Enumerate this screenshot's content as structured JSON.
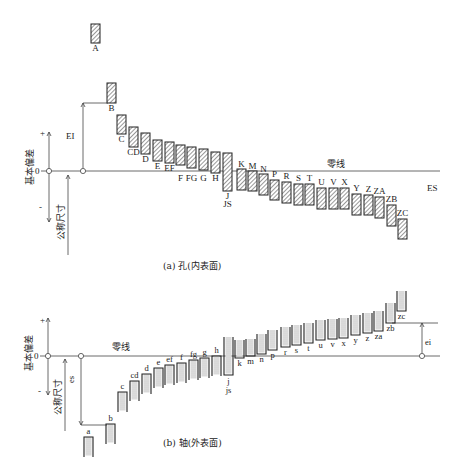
{
  "diagram": {
    "panel_a": {
      "caption": "(a) 孔(内表面)",
      "y_axis_label": "基本偏差",
      "nominal_label": "公称尺寸",
      "zero_label": "0",
      "plus_label": "+",
      "minus_label": "-",
      "zero_line_label": "零线",
      "lower_deviation_label": "EI",
      "upper_deviation_label": "ES",
      "boxes": [
        {
          "label": "A",
          "x": 91,
          "top": 24,
          "bottom": 43
        },
        {
          "label": "B",
          "x": 107,
          "top": 83,
          "bottom": 103
        },
        {
          "label": "C",
          "x": 117,
          "top": 115,
          "bottom": 134
        },
        {
          "label": "CD",
          "x": 129,
          "top": 127,
          "bottom": 147
        },
        {
          "label": "D",
          "x": 141,
          "top": 133,
          "bottom": 154
        },
        {
          "label": "E",
          "x": 153,
          "top": 140,
          "bottom": 161
        },
        {
          "label": "EF",
          "x": 165,
          "top": 142,
          "bottom": 163
        },
        {
          "label": "F",
          "x": 176,
          "top": 145,
          "bottom": 165
        },
        {
          "label": "FG",
          "x": 187,
          "top": 147,
          "bottom": 168
        },
        {
          "label": "G",
          "x": 199,
          "top": 149,
          "bottom": 170
        },
        {
          "label": "H",
          "x": 211,
          "top": 152,
          "bottom": 173
        },
        {
          "label": "J",
          "sub": "JS",
          "x": 223,
          "top": 153,
          "bottom": 191
        },
        {
          "label": "K",
          "x": 237,
          "top": 169,
          "bottom": 190
        },
        {
          "label": "M",
          "x": 248,
          "top": 171,
          "bottom": 191
        },
        {
          "label": "N",
          "x": 259,
          "top": 174,
          "bottom": 195
        },
        {
          "label": "P",
          "x": 270,
          "top": 180,
          "bottom": 200
        },
        {
          "label": "R",
          "x": 282,
          "top": 182,
          "bottom": 203
        },
        {
          "label": "S",
          "x": 294,
          "top": 184,
          "bottom": 205
        },
        {
          "label": "T",
          "x": 305,
          "top": 184,
          "bottom": 205
        },
        {
          "label": "U",
          "x": 317,
          "top": 188,
          "bottom": 209
        },
        {
          "label": "V",
          "x": 329,
          "top": 188,
          "bottom": 209
        },
        {
          "label": "X",
          "x": 340,
          "top": 188,
          "bottom": 209
        },
        {
          "label": "Y",
          "x": 352,
          "top": 194,
          "bottom": 215
        },
        {
          "label": "Z",
          "x": 364,
          "top": 195,
          "bottom": 215
        },
        {
          "label": "ZA",
          "x": 375,
          "top": 197,
          "bottom": 218
        },
        {
          "label": "ZB",
          "x": 387,
          "top": 205,
          "bottom": 226
        },
        {
          "label": "ZC",
          "x": 398,
          "top": 219,
          "bottom": 239
        }
      ]
    },
    "panel_b": {
      "caption": "(b) 轴(外表面)",
      "y_axis_label": "基本偏差",
      "nominal_label": "公称尺寸",
      "zero_label": "0",
      "plus_label": "+",
      "minus_label": "-",
      "zero_line_label": "零线",
      "upper_deviation_label": "es",
      "lower_deviation_label": "ei",
      "boxes": [
        {
          "label": "a",
          "x": 84,
          "top": 437,
          "bottom": 457
        },
        {
          "label": "b",
          "x": 106,
          "top": 424,
          "bottom": 444
        },
        {
          "label": "c",
          "x": 118,
          "top": 392,
          "bottom": 412
        },
        {
          "label": "cd",
          "x": 130,
          "top": 381,
          "bottom": 401
        },
        {
          "label": "d",
          "x": 142,
          "top": 374,
          "bottom": 394
        },
        {
          "label": "e",
          "x": 154,
          "top": 368,
          "bottom": 388
        },
        {
          "label": "ef",
          "x": 165,
          "top": 365,
          "bottom": 385
        },
        {
          "label": "f",
          "x": 177,
          "top": 363,
          "bottom": 383
        },
        {
          "label": "fg",
          "x": 189,
          "top": 360,
          "bottom": 380
        },
        {
          "label": "g",
          "x": 200,
          "top": 358,
          "bottom": 378
        },
        {
          "label": "h",
          "x": 212,
          "top": 356,
          "bottom": 376
        },
        {
          "label": "j",
          "sub": "js",
          "x": 224,
          "top": 337,
          "bottom": 375
        },
        {
          "label": "k",
          "x": 235,
          "top": 340,
          "bottom": 358
        },
        {
          "label": "m",
          "x": 246,
          "top": 339,
          "bottom": 356
        },
        {
          "label": "n",
          "x": 257,
          "top": 334,
          "bottom": 354
        },
        {
          "label": "p",
          "x": 268,
          "top": 330,
          "bottom": 350
        },
        {
          "label": "r",
          "x": 281,
          "top": 327,
          "bottom": 347
        },
        {
          "label": "s",
          "x": 292,
          "top": 325,
          "bottom": 345
        },
        {
          "label": "t",
          "x": 304,
          "top": 323,
          "bottom": 343
        },
        {
          "label": "u",
          "x": 316,
          "top": 320,
          "bottom": 340
        },
        {
          "label": "v",
          "x": 328,
          "top": 319,
          "bottom": 339
        },
        {
          "label": "x",
          "x": 339,
          "top": 318,
          "bottom": 338
        },
        {
          "label": "y",
          "x": 351,
          "top": 315,
          "bottom": 335
        },
        {
          "label": "z",
          "x": 363,
          "top": 313,
          "bottom": 333
        },
        {
          "label": "za",
          "x": 374,
          "top": 311,
          "bottom": 331
        },
        {
          "label": "zb",
          "x": 386,
          "top": 303,
          "bottom": 323
        },
        {
          "label": "zc",
          "x": 397,
          "top": 291,
          "bottom": 311
        }
      ]
    }
  }
}
